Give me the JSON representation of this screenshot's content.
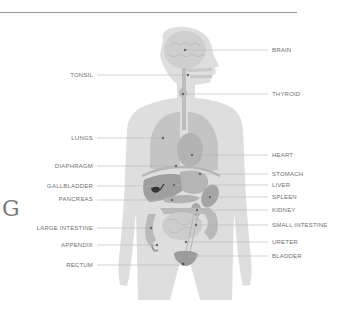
{
  "diagram": {
    "edge_letter": "G",
    "colors": {
      "body": "#dedede",
      "organ_dark": "#a9a9a9",
      "organ_mid": "#bdbdbd",
      "organ_light": "#cbcbcb",
      "gallbladder": "#333333",
      "leader_line": "#b5b5b5",
      "label_text": "#6f6f6f"
    },
    "labels_left": [
      {
        "id": "tonsil",
        "text": "TONSIL"
      },
      {
        "id": "lungs",
        "text": "LUNGS"
      },
      {
        "id": "diaphragm",
        "text": "DIAPHRAGM"
      },
      {
        "id": "gallbladder",
        "text": "GALLBLADDER"
      },
      {
        "id": "pancreas",
        "text": "PANCREAS"
      },
      {
        "id": "large_intestine",
        "text": "LARGE INTESTINE"
      },
      {
        "id": "appendix",
        "text": "APPENDIX"
      },
      {
        "id": "rectum",
        "text": "RECTUM"
      }
    ],
    "labels_right": [
      {
        "id": "brain",
        "text": "BRAIN"
      },
      {
        "id": "thyroid",
        "text": "THYROID"
      },
      {
        "id": "heart",
        "text": "HEART"
      },
      {
        "id": "stomach",
        "text": "STOMACH"
      },
      {
        "id": "liver",
        "text": "LIVER"
      },
      {
        "id": "spleen",
        "text": "SPLEEN"
      },
      {
        "id": "kidney",
        "text": "KIDNEY"
      },
      {
        "id": "small_intestine",
        "text": "SMALL INTESTINE"
      },
      {
        "id": "ureter",
        "text": "URETER"
      },
      {
        "id": "bladder",
        "text": "BLADDER"
      }
    ]
  }
}
